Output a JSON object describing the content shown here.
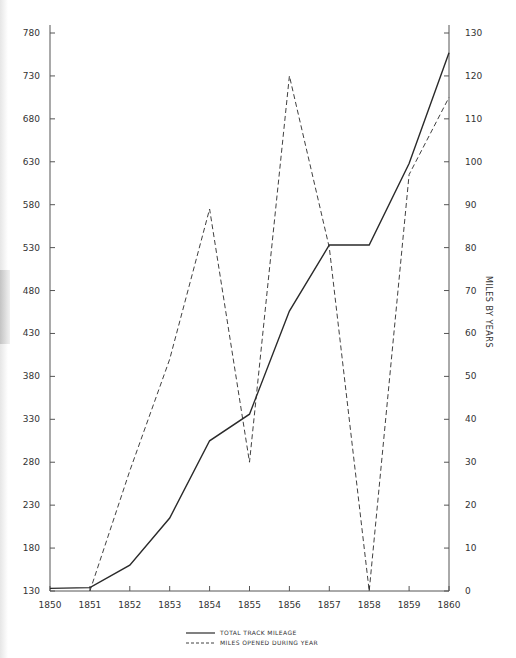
{
  "chart_data": {
    "type": "line",
    "title": "",
    "xlabel": "",
    "ylabel_left": "",
    "ylabel_right": "MILES BY YEARS",
    "x": [
      1850,
      1851,
      1852,
      1853,
      1854,
      1855,
      1856,
      1857,
      1858,
      1859,
      1860
    ],
    "x_ticks": [
      "1850",
      "1851",
      "1852",
      "1853",
      "1854",
      "1855",
      "1856",
      "1857",
      "1858",
      "1859",
      "1860"
    ],
    "left_axis": {
      "ylim": [
        130,
        780
      ],
      "ticks": [
        "130",
        "180",
        "230",
        "280",
        "330",
        "380",
        "430",
        "480",
        "530",
        "580",
        "630",
        "680",
        "730",
        "780"
      ]
    },
    "right_axis": {
      "ylim": [
        0,
        130
      ],
      "ticks": [
        "0",
        "10",
        "20",
        "30",
        "40",
        "50",
        "60",
        "70",
        "80",
        "90",
        "100",
        "110",
        "120",
        "130"
      ]
    },
    "series": [
      {
        "name": "TOTAL TRACK MILEAGE",
        "axis": "left",
        "style": "solid",
        "values": [
          133,
          134,
          160,
          215,
          305,
          336,
          456,
          533,
          533,
          628,
          757
        ]
      },
      {
        "name": "MILES OPENED DURING YEAR",
        "axis": "right",
        "style": "dashed",
        "values": [
          null,
          0,
          28,
          54,
          89,
          30,
          120,
          80,
          0,
          97,
          115
        ]
      }
    ],
    "grid": false,
    "legend_position": "bottom-center"
  },
  "legend": {
    "items": [
      {
        "label": "TOTAL TRACK MILEAGE",
        "style": "solid"
      },
      {
        "label": "MILES OPENED DURING YEAR",
        "style": "dashed"
      }
    ]
  },
  "colors": {
    "line": "#2a2a2a",
    "axis": "#555555"
  }
}
